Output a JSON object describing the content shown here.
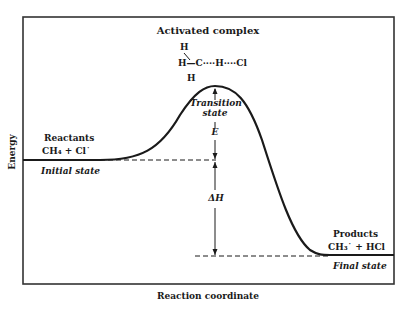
{
  "diagram": {
    "type": "energy-profile",
    "x_axis_label": "Reaction coordinate",
    "y_axis_label": "Energy",
    "activated_complex": {
      "title": "Activated complex",
      "structure_line1": "H",
      "structure_line2": "H—C····H····Cl",
      "structure_line3": "H"
    },
    "transition_state": {
      "label_line1": "Transition",
      "label_line2": "state"
    },
    "activation_energy_label": "E",
    "enthalpy_label": "ΔH",
    "reactants": {
      "title": "Reactants",
      "formula": "CH₄ + Cl˙",
      "state_label": "Initial state"
    },
    "products": {
      "title": "Products",
      "formula": "CH₃˙ + HCl",
      "state_label": "Final state"
    },
    "colors": {
      "line": "#1a1a1a",
      "frame": "#333333",
      "background": "#ffffff"
    }
  }
}
